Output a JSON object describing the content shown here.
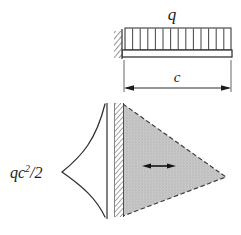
{
  "figure": {
    "title_label": "",
    "type": "engineering-diagram",
    "colors": {
      "ink": "#1c1c1c",
      "line": "#333333",
      "shade_fill": "#c9c9c9",
      "shade_dot": "#8f8f8f",
      "background": "#ffffff"
    },
    "labels": {
      "load": "q",
      "span": "c",
      "moment_base": "qc",
      "moment_exponent": "2",
      "moment_divisor": "/2",
      "moment_full": "qc²/2"
    },
    "beam": {
      "load_tick_count": 14,
      "support": "fixed-wall-left",
      "span_label": "c"
    },
    "moment_diagram": {
      "shape": "triangle",
      "shading": "dotted-stipple",
      "edge_style": "dashed",
      "support": "fixed-wall-left",
      "arrow": "double-headed-horizontal",
      "curve_shape": "concave-cusp",
      "peak_label": "qc²/2",
      "peak_location": "at-wall"
    }
  }
}
